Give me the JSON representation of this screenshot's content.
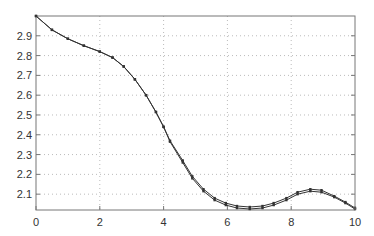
{
  "chart_data": {
    "type": "line",
    "title": "",
    "xlabel": "",
    "ylabel": "",
    "xlim": [
      0,
      10
    ],
    "ylim": [
      2.02,
      3.0
    ],
    "grid": true,
    "legend": null,
    "xticks": [
      "0",
      "2",
      "4",
      "6",
      "8",
      "10"
    ],
    "yticks": [
      "2.1",
      "2.2",
      "2.3",
      "2.4",
      "2.5",
      "2.6",
      "2.7",
      "2.8",
      "2.9"
    ],
    "series": [
      {
        "name": "series-1",
        "marker": "dot",
        "x": [
          0,
          0.5,
          1.0,
          1.5,
          2.0,
          2.4,
          2.75,
          3.1,
          3.45,
          3.76,
          4.0,
          4.2,
          4.6,
          4.9,
          5.25,
          5.6,
          5.95,
          6.3,
          6.7,
          7.1,
          7.45,
          7.85,
          8.2,
          8.6,
          8.95,
          9.35,
          9.7,
          10.0
        ],
        "y": [
          3.0,
          2.93,
          2.885,
          2.85,
          2.82,
          2.79,
          2.745,
          2.68,
          2.6,
          2.515,
          2.44,
          2.37,
          2.27,
          2.19,
          2.125,
          2.08,
          2.055,
          2.04,
          2.035,
          2.04,
          2.055,
          2.08,
          2.11,
          2.125,
          2.12,
          2.09,
          2.06,
          2.03
        ]
      },
      {
        "name": "series-2",
        "marker": "dot",
        "x": [
          0,
          0.5,
          1.0,
          1.5,
          2.0,
          2.4,
          2.75,
          3.1,
          3.45,
          3.76,
          4.0,
          4.2,
          4.6,
          4.9,
          5.25,
          5.6,
          5.95,
          6.3,
          6.7,
          7.1,
          7.45,
          7.85,
          8.2,
          8.6,
          8.95,
          9.35,
          9.7,
          10.0
        ],
        "y": [
          3.0,
          2.93,
          2.885,
          2.85,
          2.82,
          2.79,
          2.745,
          2.68,
          2.6,
          2.515,
          2.44,
          2.365,
          2.26,
          2.18,
          2.115,
          2.07,
          2.045,
          2.03,
          2.025,
          2.03,
          2.045,
          2.07,
          2.1,
          2.115,
          2.11,
          2.085,
          2.055,
          2.025
        ]
      }
    ]
  },
  "colors": {
    "line": "#333333",
    "grid": "#bbbbbb",
    "axis": "#777777"
  }
}
